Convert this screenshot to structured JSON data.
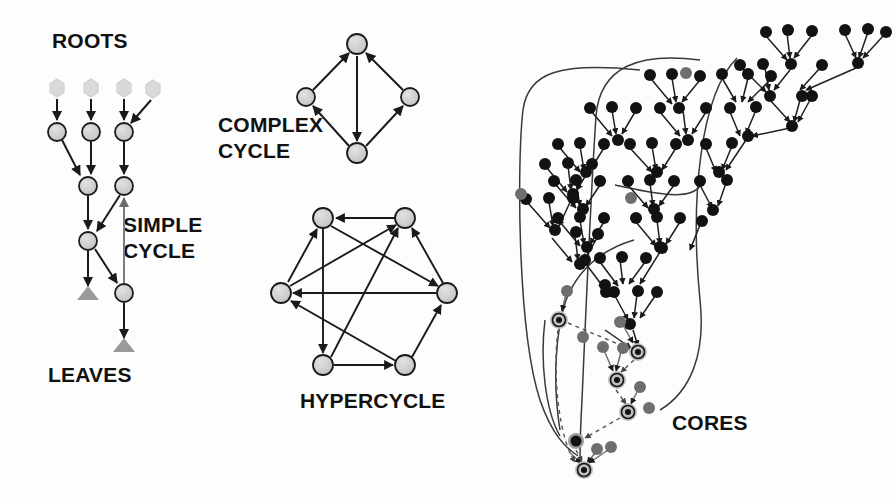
{
  "figure": {
    "background_color": "#fdfdfd",
    "labels": {
      "roots": "ROOTS",
      "leaves": "LEAVES",
      "simple_cycle_line1": "SIMPLE",
      "simple_cycle_line2": "CYCLE",
      "complex_cycle_line1": "COMPLEX",
      "complex_cycle_line2": "CYCLE",
      "hypercycle": "HYPERCYCLE",
      "cores": "CORES"
    },
    "colors": {
      "node_gray": "#c9c9c9",
      "node_outline": "#1a1a1a",
      "root_hex": "#d9d9d9",
      "leaf_triangle": "#9a9a9a",
      "node_black": "#121212",
      "node_midgray": "#6e6e6e",
      "core_ring": "#bdbdbd",
      "edge": "#1a1a1a",
      "dashed_edge": "#555555",
      "text": "#111111"
    }
  },
  "panels": {
    "tree_panel": {
      "name": "roots-leaves-tree",
      "label_roots_pos": {
        "x": 52,
        "y": 48
      },
      "label_leaves_pos": {
        "x": 48,
        "y": 382
      },
      "label_simple_cycle_pos": {
        "x": 123,
        "y": 232
      },
      "roots": [
        {
          "id": "r1",
          "x": 57,
          "y": 88,
          "shape": "hexagon",
          "color": "#d9d9d9"
        },
        {
          "id": "r2",
          "x": 91,
          "y": 88,
          "shape": "hexagon",
          "color": "#d9d9d9"
        },
        {
          "id": "r3",
          "x": 124,
          "y": 88,
          "shape": "hexagon",
          "color": "#d9d9d9"
        },
        {
          "id": "r4",
          "x": 153,
          "y": 89,
          "shape": "hexagon",
          "color": "#d9d9d9"
        }
      ],
      "nodes": [
        {
          "id": "n1",
          "x": 57,
          "y": 132,
          "r": 9
        },
        {
          "id": "n2",
          "x": 91,
          "y": 132,
          "r": 9
        },
        {
          "id": "n3",
          "x": 124,
          "y": 132,
          "r": 9
        },
        {
          "id": "n4",
          "x": 88,
          "y": 186,
          "r": 9
        },
        {
          "id": "n5",
          "x": 124,
          "y": 186,
          "r": 9
        },
        {
          "id": "n6",
          "x": 88,
          "y": 241,
          "r": 9
        },
        {
          "id": "n7",
          "x": 124,
          "y": 293,
          "r": 9
        }
      ],
      "leaf_markers": [
        {
          "id": "t1",
          "x": 88,
          "y": 296
        },
        {
          "id": "t2",
          "x": 124,
          "y": 348
        }
      ],
      "edges": [
        {
          "from": "r1",
          "to": "n1",
          "style": "solid"
        },
        {
          "from": "r2",
          "to": "n2",
          "style": "solid"
        },
        {
          "from": "r3",
          "to": "n3",
          "style": "solid"
        },
        {
          "from": "r4",
          "to": "n3",
          "style": "solid"
        },
        {
          "from": "n1",
          "to": "n4",
          "style": "solid"
        },
        {
          "from": "n2",
          "to": "n4",
          "style": "solid"
        },
        {
          "from": "n3",
          "to": "n5",
          "style": "solid"
        },
        {
          "from": "n4",
          "to": "n6",
          "style": "solid"
        },
        {
          "from": "n5",
          "to": "n6",
          "style": "solid"
        },
        {
          "from": "n6",
          "to": "t1",
          "style": "solid"
        },
        {
          "from": "n6",
          "to": "n7",
          "style": "solid"
        },
        {
          "from": "n7",
          "to": "n5",
          "style": "cycle"
        },
        {
          "from": "n7",
          "to": "t2",
          "style": "solid"
        }
      ],
      "cycle_note": "simple cycle formed by n5 -> n6 -> n7 -> n5"
    },
    "complex_cycle_panel": {
      "name": "complex-cycle",
      "label_pos": {
        "x": 218,
        "y": 132
      },
      "nodes": [
        {
          "id": "c_top",
          "x": 357,
          "y": 44,
          "r": 10
        },
        {
          "id": "c_left",
          "x": 306,
          "y": 97,
          "r": 9
        },
        {
          "id": "c_right",
          "x": 410,
          "y": 97,
          "r": 9
        },
        {
          "id": "c_bottom",
          "x": 357,
          "y": 153,
          "r": 10
        }
      ],
      "edges": [
        {
          "from": "c_left",
          "to": "c_top",
          "style": "solid"
        },
        {
          "from": "c_right",
          "to": "c_top",
          "style": "solid"
        },
        {
          "from": "c_top",
          "to": "c_bottom",
          "style": "solid"
        },
        {
          "from": "c_bottom",
          "to": "c_left",
          "style": "solid"
        },
        {
          "from": "c_bottom",
          "to": "c_right",
          "style": "solid"
        }
      ]
    },
    "hypercycle_panel": {
      "name": "hypercycle",
      "label_pos": {
        "x": 300,
        "y": 408
      },
      "nodes": [
        {
          "id": "h_tl",
          "x": 323,
          "y": 218,
          "r": 10
        },
        {
          "id": "h_tr",
          "x": 405,
          "y": 218,
          "r": 10
        },
        {
          "id": "h_r",
          "x": 447,
          "y": 293,
          "r": 10
        },
        {
          "id": "h_br",
          "x": 405,
          "y": 365,
          "r": 10
        },
        {
          "id": "h_bl",
          "x": 323,
          "y": 365,
          "r": 10
        },
        {
          "id": "h_l",
          "x": 281,
          "y": 293,
          "r": 10
        }
      ],
      "edges": [
        {
          "from": "h_tr",
          "to": "h_tl",
          "style": "solid"
        },
        {
          "from": "h_tl",
          "to": "h_bl",
          "style": "solid"
        },
        {
          "from": "h_bl",
          "to": "h_br",
          "style": "solid"
        },
        {
          "from": "h_br",
          "to": "h_r",
          "style": "solid"
        },
        {
          "from": "h_r",
          "to": "h_tr",
          "style": "solid"
        },
        {
          "from": "h_l",
          "to": "h_tl",
          "style": "solid"
        },
        {
          "from": "h_r",
          "to": "h_l",
          "style": "solid"
        },
        {
          "from": "h_bl",
          "to": "h_tr",
          "style": "solid"
        },
        {
          "from": "h_l",
          "to": "h_tr",
          "style": "solid"
        },
        {
          "from": "h_br",
          "to": "h_l",
          "style": "solid"
        },
        {
          "from": "h_tl",
          "to": "h_r",
          "style": "solid"
        }
      ]
    },
    "cores_panel": {
      "name": "cores-network",
      "label_pos": {
        "x": 672,
        "y": 430
      },
      "description": "Large dense hierarchical network of black leaf nodes flowing down-left into gray core nodes linked by dashed edges",
      "core_nodes": [
        {
          "id": "core1",
          "x": 559,
          "y": 320
        },
        {
          "id": "core2",
          "x": 638,
          "y": 352
        },
        {
          "id": "core3",
          "x": 617,
          "y": 380
        },
        {
          "id": "core4",
          "x": 628,
          "y": 412
        },
        {
          "id": "core5",
          "x": 576,
          "y": 441
        },
        {
          "id": "core6",
          "x": 584,
          "y": 470
        }
      ],
      "core_dashed_edges": [
        {
          "from": "core1",
          "to": "core2"
        },
        {
          "from": "core2",
          "to": "core3"
        },
        {
          "from": "core3",
          "to": "core4"
        },
        {
          "from": "core4",
          "to": "core5"
        },
        {
          "from": "core1",
          "to": "core6"
        },
        {
          "from": "core5",
          "to": "core6"
        }
      ]
    }
  },
  "legend_items": [
    {
      "name": "root-node",
      "shape": "hexagon",
      "color": "#d9d9d9",
      "meaning": "ROOTS"
    },
    {
      "name": "internal-node",
      "shape": "circle",
      "color": "#c9c9c9",
      "meaning": "internal vertex"
    },
    {
      "name": "leaf-marker",
      "shape": "triangle",
      "color": "#9a9a9a",
      "meaning": "LEAVES"
    },
    {
      "name": "core-node",
      "shape": "ringed-circle",
      "color": "#121212",
      "meaning": "CORES"
    }
  ]
}
